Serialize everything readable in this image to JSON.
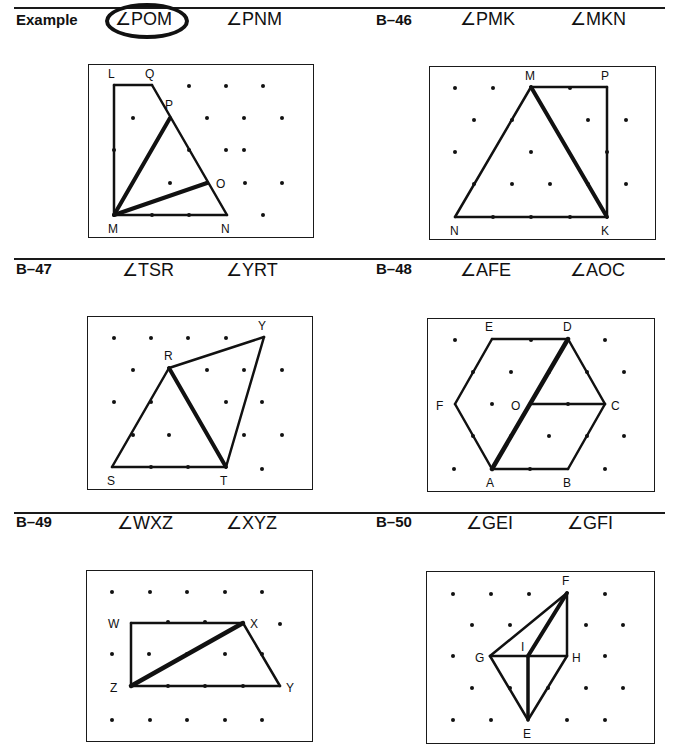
{
  "rules": [
    {
      "x": 14,
      "y": 7,
      "w": 651
    },
    {
      "x": 14,
      "y": 258,
      "w": 651
    },
    {
      "x": 14,
      "y": 512,
      "w": 651
    }
  ],
  "problems": [
    {
      "id": "example",
      "label": "Example",
      "lx": 16,
      "ly": 27,
      "angles": [
        {
          "text": "∠POM",
          "x": 115,
          "y": 25,
          "circled": true
        },
        {
          "text": "∠PNM",
          "x": 226,
          "y": 25,
          "circled": false
        }
      ],
      "box": {
        "x": 88,
        "y": 64,
        "w": 224,
        "h": 172
      },
      "dots": [
        [
          189,
          86
        ],
        [
          226,
          86
        ],
        [
          263,
          86
        ],
        [
          133,
          118
        ],
        [
          207,
          118
        ],
        [
          244,
          118
        ],
        [
          282,
          118
        ],
        [
          114,
          150
        ],
        [
          189,
          150
        ],
        [
          226,
          150
        ],
        [
          244,
          150
        ],
        [
          170,
          183
        ],
        [
          207,
          183
        ],
        [
          245,
          183
        ],
        [
          282,
          183
        ],
        [
          152,
          215
        ],
        [
          189,
          215
        ],
        [
          263,
          215
        ]
      ],
      "lines": [
        [
          114,
          85,
          152,
          85,
          2.5
        ],
        [
          114,
          85,
          114,
          215,
          2.5
        ],
        [
          152,
          85,
          227,
          215,
          2.5
        ],
        [
          114,
          215,
          227,
          215,
          2.5
        ],
        [
          114,
          215,
          170,
          118,
          4
        ],
        [
          114,
          215,
          207,
          183,
          4
        ]
      ],
      "points": [
        {
          "n": "L",
          "x": 108,
          "y": 78
        },
        {
          "n": "Q",
          "x": 145,
          "y": 78
        },
        {
          "n": "P",
          "x": 165,
          "y": 109
        },
        {
          "n": "O",
          "x": 216,
          "y": 188
        },
        {
          "n": "M",
          "x": 108,
          "y": 233
        },
        {
          "n": "N",
          "x": 221,
          "y": 233
        }
      ]
    },
    {
      "id": "B-46",
      "label": "B–46",
      "lx": 376,
      "ly": 27,
      "angles": [
        {
          "text": "∠PMK",
          "x": 460,
          "y": 25,
          "circled": false
        },
        {
          "text": "∠MKN",
          "x": 570,
          "y": 25,
          "circled": false
        }
      ],
      "box": {
        "x": 429,
        "y": 66,
        "w": 225,
        "h": 172
      },
      "dots": [
        [
          455,
          88
        ],
        [
          493,
          88
        ],
        [
          570,
          88
        ],
        [
          474,
          120
        ],
        [
          512,
          120
        ],
        [
          588,
          120
        ],
        [
          626,
          120
        ],
        [
          455,
          152
        ],
        [
          531,
          152
        ],
        [
          607,
          152
        ],
        [
          474,
          184
        ],
        [
          512,
          184
        ],
        [
          550,
          184
        ],
        [
          588,
          184
        ],
        [
          626,
          184
        ],
        [
          493,
          217
        ],
        [
          531,
          217
        ],
        [
          570,
          217
        ]
      ],
      "lines": [
        [
          531,
          87,
          607,
          87,
          2.5
        ],
        [
          607,
          87,
          607,
          217,
          2.5
        ],
        [
          455,
          217,
          607,
          217,
          2.5
        ],
        [
          455,
          217,
          531,
          87,
          2.5
        ],
        [
          531,
          87,
          607,
          217,
          4
        ]
      ],
      "points": [
        {
          "n": "M",
          "x": 525,
          "y": 80
        },
        {
          "n": "P",
          "x": 601,
          "y": 80
        },
        {
          "n": "N",
          "x": 450,
          "y": 235
        },
        {
          "n": "K",
          "x": 601,
          "y": 235
        }
      ]
    },
    {
      "id": "B-47",
      "label": "B–47",
      "lx": 16,
      "ly": 276,
      "angles": [
        {
          "text": "∠TSR",
          "x": 122,
          "y": 276,
          "circled": false
        },
        {
          "text": "∠YRT",
          "x": 226,
          "y": 276,
          "circled": false
        }
      ],
      "box": {
        "x": 87,
        "y": 316,
        "w": 224,
        "h": 172
      },
      "dots": [
        [
          114,
          338
        ],
        [
          151,
          338
        ],
        [
          188,
          338
        ],
        [
          226,
          338
        ],
        [
          133,
          370
        ],
        [
          207,
          370
        ],
        [
          244,
          370
        ],
        [
          282,
          370
        ],
        [
          114,
          402
        ],
        [
          151,
          402
        ],
        [
          226,
          402
        ],
        [
          262,
          402
        ],
        [
          133,
          435
        ],
        [
          169,
          435
        ],
        [
          244,
          435
        ],
        [
          282,
          435
        ],
        [
          151,
          467
        ],
        [
          188,
          467
        ],
        [
          262,
          469
        ]
      ],
      "lines": [
        [
          112,
          467,
          226,
          467,
          2.5
        ],
        [
          112,
          467,
          169,
          368,
          2.5
        ],
        [
          169,
          368,
          264,
          337,
          2.5
        ],
        [
          264,
          337,
          226,
          467,
          2.5
        ],
        [
          169,
          368,
          226,
          467,
          4
        ]
      ],
      "points": [
        {
          "n": "R",
          "x": 164,
          "y": 360
        },
        {
          "n": "Y",
          "x": 258,
          "y": 330
        },
        {
          "n": "S",
          "x": 107,
          "y": 485
        },
        {
          "n": "T",
          "x": 220,
          "y": 485
        }
      ]
    },
    {
      "id": "B-48",
      "label": "B–48",
      "lx": 376,
      "ly": 276,
      "angles": [
        {
          "text": "∠AFE",
          "x": 460,
          "y": 276,
          "circled": false
        },
        {
          "text": "∠AOC",
          "x": 570,
          "y": 276,
          "circled": false
        }
      ],
      "box": {
        "x": 427,
        "y": 318,
        "w": 226,
        "h": 172
      },
      "dots": [
        [
          455,
          340
        ],
        [
          531,
          340
        ],
        [
          605,
          340
        ],
        [
          473,
          372
        ],
        [
          511,
          372
        ],
        [
          549,
          372
        ],
        [
          587,
          372
        ],
        [
          624,
          372
        ],
        [
          492,
          404
        ],
        [
          568,
          404
        ],
        [
          473,
          436
        ],
        [
          511,
          436
        ],
        [
          549,
          436
        ],
        [
          587,
          436
        ],
        [
          624,
          436
        ],
        [
          454,
          469
        ],
        [
          530,
          469
        ],
        [
          605,
          469
        ]
      ],
      "lines": [
        [
          492,
          339,
          568,
          339,
          2.5
        ],
        [
          568,
          339,
          605,
          404,
          2.5
        ],
        [
          605,
          404,
          568,
          469,
          2.5
        ],
        [
          568,
          469,
          492,
          469,
          2.5
        ],
        [
          492,
          469,
          455,
          404,
          2.5
        ],
        [
          455,
          404,
          492,
          339,
          2.5
        ],
        [
          530,
          404,
          605,
          404,
          2.5
        ],
        [
          492,
          469,
          568,
          339,
          4.5
        ]
      ],
      "points": [
        {
          "n": "E",
          "x": 485,
          "y": 331
        },
        {
          "n": "D",
          "x": 563,
          "y": 331
        },
        {
          "n": "F",
          "x": 436,
          "y": 410
        },
        {
          "n": "O",
          "x": 511,
          "y": 410
        },
        {
          "n": "C",
          "x": 611,
          "y": 410
        },
        {
          "n": "A",
          "x": 486,
          "y": 487
        },
        {
          "n": "B",
          "x": 563,
          "y": 487
        }
      ]
    },
    {
      "id": "B-49",
      "label": "B–49",
      "lx": 16,
      "ly": 529,
      "angles": [
        {
          "text": "∠WXZ",
          "x": 117,
          "y": 529,
          "circled": false
        },
        {
          "text": "∠XYZ",
          "x": 226,
          "y": 529,
          "circled": false
        }
      ],
      "box": {
        "x": 86,
        "y": 570,
        "w": 225,
        "h": 170
      },
      "dots": [
        [
          112,
          592
        ],
        [
          150,
          592
        ],
        [
          187,
          592
        ],
        [
          225,
          592
        ],
        [
          262,
          592
        ],
        [
          168,
          622
        ],
        [
          205,
          622
        ],
        [
          280,
          624
        ],
        [
          112,
          654
        ],
        [
          149,
          654
        ],
        [
          187,
          654
        ],
        [
          225,
          654
        ],
        [
          262,
          654
        ],
        [
          168,
          686
        ],
        [
          205,
          686
        ],
        [
          243,
          686
        ],
        [
          112,
          720
        ],
        [
          150,
          720
        ],
        [
          187,
          720
        ],
        [
          225,
          720
        ],
        [
          262,
          720
        ]
      ],
      "lines": [
        [
          131,
          623,
          243,
          623,
          2.5
        ],
        [
          131,
          623,
          131,
          686,
          2.5
        ],
        [
          131,
          686,
          280,
          686,
          2.5
        ],
        [
          243,
          623,
          280,
          686,
          2.5
        ],
        [
          131,
          686,
          243,
          623,
          4.5
        ]
      ],
      "points": [
        {
          "n": "W",
          "x": 108,
          "y": 628
        },
        {
          "n": "X",
          "x": 250,
          "y": 628
        },
        {
          "n": "Z",
          "x": 110,
          "y": 692
        },
        {
          "n": "Y",
          "x": 286,
          "y": 692
        }
      ]
    },
    {
      "id": "B-50",
      "label": "B–50",
      "lx": 376,
      "ly": 529,
      "angles": [
        {
          "text": "∠GEI",
          "x": 466,
          "y": 529,
          "circled": false
        },
        {
          "text": "∠GFI",
          "x": 567,
          "y": 529,
          "circled": false
        }
      ],
      "box": {
        "x": 426,
        "y": 571,
        "w": 227,
        "h": 171
      },
      "dots": [
        [
          453,
          594
        ],
        [
          491,
          594
        ],
        [
          529,
          594
        ],
        [
          605,
          594
        ],
        [
          472,
          625
        ],
        [
          510,
          625
        ],
        [
          586,
          625
        ],
        [
          623,
          625
        ],
        [
          453,
          656
        ],
        [
          605,
          656
        ],
        [
          472,
          688
        ],
        [
          510,
          688
        ],
        [
          548,
          688
        ],
        [
          586,
          688
        ],
        [
          623,
          688
        ],
        [
          453,
          720
        ],
        [
          491,
          720
        ],
        [
          567,
          720
        ],
        [
          605,
          720
        ]
      ],
      "lines": [
        [
          490,
          656,
          567,
          593,
          2.5
        ],
        [
          567,
          593,
          567,
          656,
          2.5
        ],
        [
          490,
          656,
          567,
          656,
          2.5
        ],
        [
          490,
          656,
          528,
          720,
          2.5
        ],
        [
          567,
          656,
          528,
          720,
          2.5
        ],
        [
          528,
          656,
          528,
          720,
          3.5
        ],
        [
          528,
          656,
          567,
          593,
          4
        ]
      ],
      "points": [
        {
          "n": "F",
          "x": 562,
          "y": 585
        },
        {
          "n": "I",
          "x": 521,
          "y": 651
        },
        {
          "n": "G",
          "x": 475,
          "y": 662
        },
        {
          "n": "H",
          "x": 572,
          "y": 662
        },
        {
          "n": "E",
          "x": 523,
          "y": 738
        }
      ]
    }
  ]
}
